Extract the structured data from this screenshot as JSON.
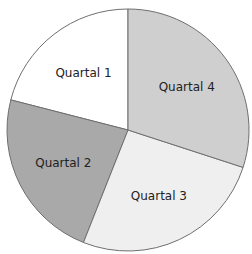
{
  "chart_data": {
    "type": "pie",
    "title": "",
    "categories": [
      "Quartal 1",
      "Quartal 2",
      "Quartal 3",
      "Quartal 4"
    ],
    "values": [
      21,
      23,
      26,
      30
    ],
    "colors": [
      "#ffffff",
      "#a9a9a9",
      "#efefef",
      "#cfcfcf"
    ],
    "start_angle_deg": 90,
    "direction": "counterclockwise",
    "legend": "none",
    "labels_inside": true
  },
  "layout": {
    "cx": 128,
    "cy": 130,
    "r": 121,
    "stroke": "#6f6f6f"
  }
}
